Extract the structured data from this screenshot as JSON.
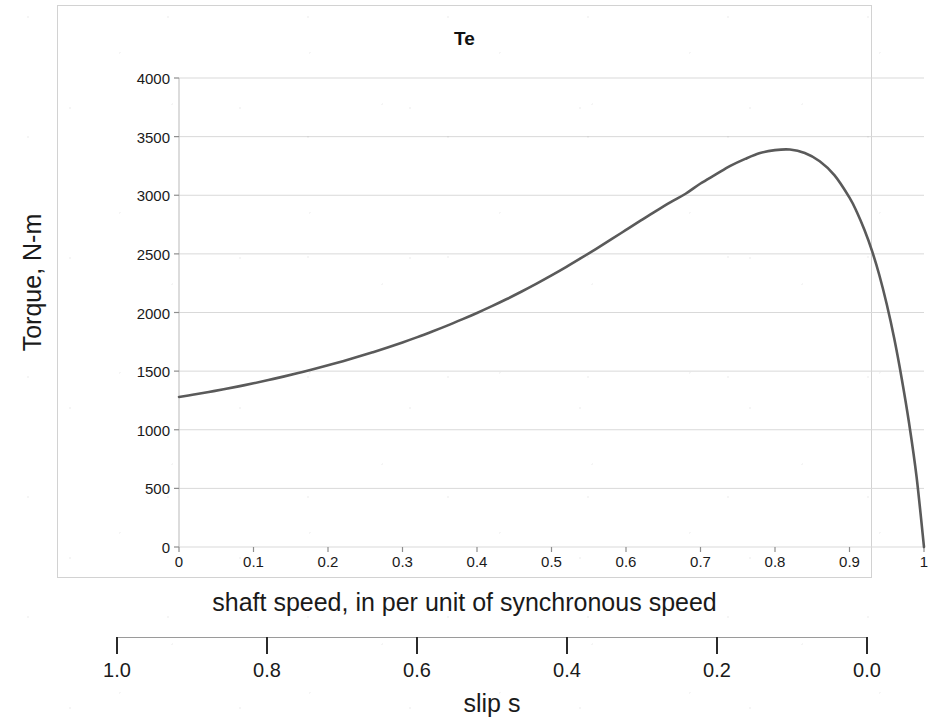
{
  "chart_data": {
    "type": "line",
    "title": "Te",
    "xlabel": "shaft speed, in per unit of synchronous speed",
    "ylabel": "Torque, N-m",
    "xlim": [
      0,
      1
    ],
    "ylim": [
      0,
      4000
    ],
    "grid": true,
    "legend": null,
    "legend_position": "none",
    "line_color": "#5a5a5a",
    "grid_color": "#d9d9d9",
    "x_ticks": [
      "0",
      "0.1",
      "0.2",
      "0.3",
      "0.4",
      "0.5",
      "0.6",
      "0.7",
      "0.8",
      "0.9",
      "1"
    ],
    "x_tick_values": [
      0,
      0.1,
      0.2,
      0.3,
      0.4,
      0.5,
      0.6,
      0.7,
      0.8,
      0.9,
      1
    ],
    "y_ticks": [
      "0",
      "500",
      "1000",
      "1500",
      "2000",
      "2500",
      "3000",
      "3500",
      "4000"
    ],
    "y_tick_values": [
      0,
      500,
      1000,
      1500,
      2000,
      2500,
      3000,
      3500,
      4000
    ],
    "secondary_axis": {
      "label": "slip s",
      "ticks": [
        "1.0",
        "0.8",
        "0.6",
        "0.4",
        "0.2",
        "0.0"
      ],
      "tick_values": [
        1.0,
        0.8,
        0.6,
        0.4,
        0.2,
        0.0
      ],
      "reversed": true,
      "range": [
        1.0,
        0.0
      ]
    },
    "series": [
      {
        "name": "Te",
        "x": [
          0.0,
          0.02,
          0.04,
          0.06,
          0.08,
          0.1,
          0.12,
          0.14,
          0.16,
          0.18,
          0.2,
          0.22,
          0.24,
          0.26,
          0.28,
          0.3,
          0.32,
          0.34,
          0.36,
          0.38,
          0.4,
          0.42,
          0.44,
          0.46,
          0.48,
          0.5,
          0.52,
          0.54,
          0.56,
          0.58,
          0.6,
          0.62,
          0.64,
          0.66,
          0.68,
          0.7,
          0.72,
          0.74,
          0.76,
          0.78,
          0.8,
          0.82,
          0.84,
          0.86,
          0.88,
          0.9,
          0.91,
          0.92,
          0.93,
          0.94,
          0.95,
          0.96,
          0.97,
          0.98,
          0.99,
          1.0
        ],
        "y": [
          1280,
          1300,
          1322,
          1345,
          1370,
          1396,
          1424,
          1453,
          1484,
          1516,
          1550,
          1585,
          1622,
          1661,
          1702,
          1745,
          1790,
          1838,
          1888,
          1941,
          1996,
          2054,
          2115,
          2179,
          2246,
          2316,
          2389,
          2465,
          2543,
          2623,
          2704,
          2785,
          2865,
          2942,
          3013,
          3100,
          3175,
          3250,
          3310,
          3360,
          3385,
          3390,
          3360,
          3290,
          3170,
          2980,
          2855,
          2705,
          2530,
          2320,
          2070,
          1780,
          1440,
          1055,
          600,
          0
        ]
      }
    ],
    "annotations": {
      "peak": {
        "x": 0.82,
        "y": 3390,
        "label": ""
      },
      "start": {
        "x": 0.0,
        "y": 1280,
        "label": ""
      },
      "end": {
        "x": 1.0,
        "y": 0,
        "label": ""
      }
    }
  }
}
